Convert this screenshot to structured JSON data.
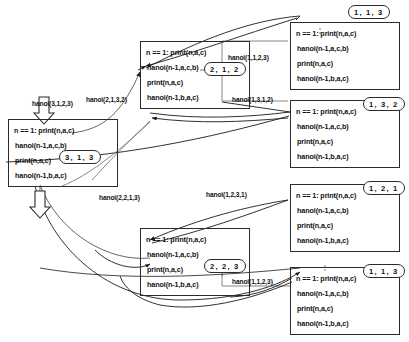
{
  "diagram": {
    "code_lines": [
      "n == 1:  print(n,a,c)",
      "hanoi(n-1,a,c,b)",
      "print(n,a,c)",
      "hanoi(n-1,b,a,c)"
    ],
    "frames": [
      {
        "id": "f-3-1-3",
        "tag": "3, 1, 3",
        "lines": [
          "n == 1:  print(n,a,c)",
          "hanoi(n-1,a,c,b)",
          "print(n,a,c)",
          "hanoi(n-1,b,a,c)"
        ]
      },
      {
        "id": "f-2-1-2",
        "tag": "2, 1, 2",
        "lines": [
          "n == 1:  print(n,a,c)",
          "hanoi(n-1,a,c,b)",
          "print(n,a,c)",
          "hanoi(n-1,b,a,c)"
        ]
      },
      {
        "id": "f-1-1-3a",
        "tag": "1, 1, 3",
        "lines": [
          "n == 1:  print(n,a,c)",
          "hanoi(n-1,a,c,b)",
          "print(n,a,c)",
          "hanoi(n-1,b,a,c)"
        ]
      },
      {
        "id": "f-1-3-2",
        "tag": "1, 3, 2",
        "lines": [
          "n == 1:  print(n,a,c)",
          "hanoi(n-1,a,c,b)",
          "print(n,a,c)",
          "hanoi(n-1,b,a,c)"
        ]
      },
      {
        "id": "f-1-2-1",
        "tag": "1, 2, 1",
        "lines": [
          "n == 1:  print(n,a,c)",
          "hanoi(n-1,a,c,b)",
          "print(n,a,c)",
          "hanoi(n-1,b,a,c)"
        ]
      },
      {
        "id": "f-2-2-3",
        "tag": "2, 2, 3",
        "lines": [
          "n == 1:  print(n,a,c)",
          "hanoi(n-1,a,c,b)",
          "print(n,a,c)",
          "hanoi(n-1,b,a,c)"
        ]
      },
      {
        "id": "f-1-1-3b",
        "tag": "1, 1, 3",
        "lines": [
          "n == 1:  print(n,a,c)",
          "hanoi(n-1,a,c,b)",
          "print(n,a,c)",
          "hanoi(n-1,b,a,c)"
        ]
      }
    ],
    "call_labels": [
      {
        "id": "c-root",
        "text": "hanoi(3,1,2,3)"
      },
      {
        "id": "c-2132",
        "text": "hanoi(2,1,3,2)"
      },
      {
        "id": "c-1123-top",
        "text": "hanoi(1,1,2,3)"
      },
      {
        "id": "c-1312",
        "text": "hanoi(1,3,1,2)"
      },
      {
        "id": "c-2213",
        "text": "hanoi(2,2,1,3)"
      },
      {
        "id": "c-1231",
        "text": "hanoi(1,2,3,1)"
      },
      {
        "id": "c-1123-bot",
        "text": "hanoi(1,1,2,3)"
      }
    ]
  }
}
